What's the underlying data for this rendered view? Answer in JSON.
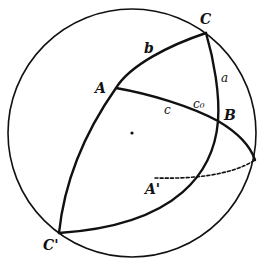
{
  "diagram": {
    "type": "spherical-triangle",
    "sphere": {
      "cx": 132,
      "cy": 133,
      "r": 124
    },
    "center_dot": {
      "x": 132,
      "y": 133
    },
    "points": {
      "A": {
        "label": "A",
        "x": 116,
        "y": 88
      },
      "B": {
        "label": "B",
        "x": 218,
        "y": 121
      },
      "C": {
        "label": "C",
        "x": 206,
        "y": 33
      },
      "C_prime": {
        "label": "C'",
        "x": 59,
        "y": 233
      },
      "A_prime": {
        "label": "A'",
        "x": 155,
        "y": 180
      }
    },
    "side_labels": {
      "a": "a",
      "b": "b",
      "c": "c",
      "c0": "c₀"
    },
    "colors": {
      "ink": "#111111",
      "background": "#ffffff"
    }
  }
}
